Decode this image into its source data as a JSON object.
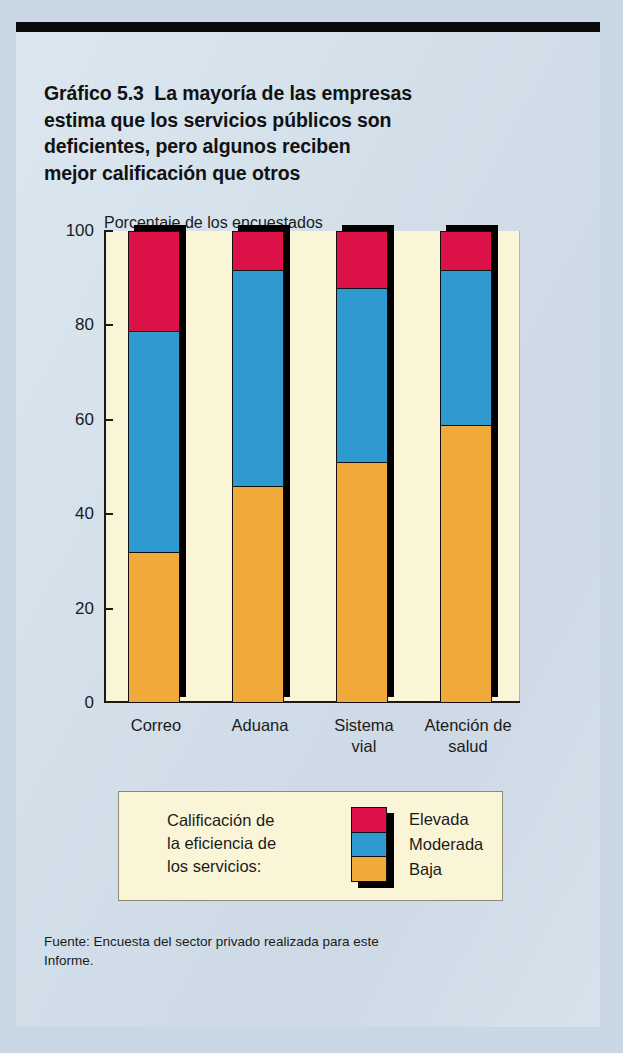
{
  "figure": {
    "title_lines": [
      "Gráfico 5.3  La mayoría de las empresas",
      "estima que los servicios públicos son",
      "deficientes, pero algunos reciben",
      "mejor calificación que otros"
    ],
    "source_lines": [
      "Fuente: Encuesta del sector privado realizada para este",
      "Informe."
    ]
  },
  "legend": {
    "caption_lines": [
      "Calificación de",
      "la eficiencia de",
      "los servicios:"
    ],
    "entries": [
      {
        "label": "Elevada",
        "color": "#DC1148"
      },
      {
        "label": "Moderada",
        "color": "#2E9AD0"
      },
      {
        "label": "Baja",
        "color": "#F2A93B"
      }
    ]
  },
  "chart_data": {
    "type": "bar",
    "stacked": true,
    "subtitle": "Porcentaje de los encuestados",
    "xlabel": "",
    "ylabel": "Porcentaje de los encuestados",
    "categories": [
      "Correo",
      "Aduana",
      "Sistema vial",
      "Atención de salud"
    ],
    "category_label_lines": [
      [
        "Correo"
      ],
      [
        "Aduana"
      ],
      [
        "Sistema",
        "vial"
      ],
      [
        "Atención de",
        "salud"
      ]
    ],
    "series": [
      {
        "name": "Baja",
        "color": "#F2A93B",
        "values": [
          32,
          46,
          51,
          59
        ]
      },
      {
        "name": "Moderada",
        "color": "#2E9AD0",
        "values": [
          47,
          46,
          37,
          33
        ]
      },
      {
        "name": "Elevada",
        "color": "#DC1148",
        "values": [
          21,
          8,
          12,
          8
        ]
      }
    ],
    "cumulative_tops": {
      "Baja": [
        32,
        46,
        51,
        59
      ],
      "Moderada": [
        79,
        92,
        88,
        92
      ],
      "Elevada": [
        100,
        100,
        100,
        100
      ]
    },
    "ylim": [
      0,
      100
    ],
    "yticks": [
      0,
      20,
      40,
      60,
      80,
      100
    ],
    "ytick_labels": [
      "0",
      "20",
      "40",
      "60",
      "80",
      "100"
    ],
    "grid": false,
    "legend_position": "below-plot",
    "plot_background": "#FBF5D8",
    "figure_background": "#D6E2EC"
  }
}
